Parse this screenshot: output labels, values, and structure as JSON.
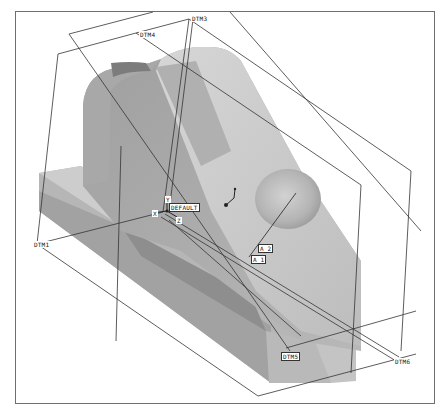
{
  "viewport": {
    "background": "#ffffff",
    "border_color": "#6e6e6e",
    "model_color_light": "#c8c8c8",
    "model_color_mid": "#a9a9a9",
    "model_color_dark": "#8c8c8c"
  },
  "datum_planes": [
    {
      "id": "dtm1",
      "label": "DTM1"
    },
    {
      "id": "dtm2",
      "label": "DTM2"
    },
    {
      "id": "dtm3",
      "label": "DTM3"
    },
    {
      "id": "dtm4",
      "label": "DTM4"
    },
    {
      "id": "dtm5",
      "label": "DTM5"
    },
    {
      "id": "dtm6",
      "label": "DTM6"
    }
  ],
  "csys": {
    "label": "DEFAULT"
  },
  "axes": [
    {
      "id": "a1",
      "label": "A_1"
    },
    {
      "id": "a2",
      "label": "A_2"
    }
  ],
  "csys_axes": {
    "x": "X",
    "y": "Y",
    "z": "Z"
  }
}
